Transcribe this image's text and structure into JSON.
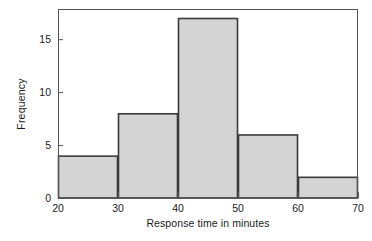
{
  "chart_data": {
    "type": "bar",
    "subtype": "histogram",
    "title": "",
    "xlabel": "Response time in minutes",
    "ylabel": "Frequency",
    "bin_edges": [
      20,
      30,
      40,
      50,
      60,
      70
    ],
    "bin_width": 10,
    "categories": [
      "20-30",
      "30-40",
      "40-50",
      "50-60",
      "60-70"
    ],
    "values": [
      4,
      8,
      17,
      6,
      2
    ],
    "x": [
      25,
      35,
      45,
      55,
      65
    ],
    "xlim": [
      20,
      70
    ],
    "ylim": [
      0,
      17.85
    ],
    "xticks": [
      20,
      30,
      40,
      50,
      60,
      70
    ],
    "yticks": [
      0,
      5,
      10,
      15
    ],
    "xtick_labels": [
      "20",
      "30",
      "40",
      "50",
      "60",
      "70"
    ],
    "ytick_labels": [
      "0",
      "5",
      "10",
      "15"
    ],
    "grid": false,
    "legend": false,
    "legend_position": "none",
    "bar_fill_color": "#d4d4d4",
    "bar_edge_color": "#3a3a3a",
    "axis_color": "#555555",
    "text_color": "#1a1a1a",
    "background_color": "#ffffff"
  }
}
